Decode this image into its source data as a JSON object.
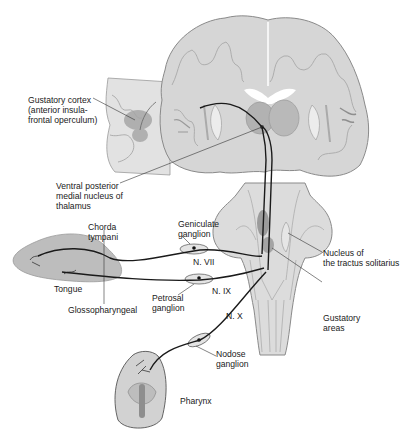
{
  "labels": {
    "gustatory_cortex": "Gustatory cortex\n(anterior insula-\nfrontal operculum)",
    "vpm_thalamus": "Ventral posterior\nmedial nucleus of\nthalamus",
    "chorda_tympani": "Chorda\ntympani",
    "geniculate_ganglion": "Geniculate\nganglion",
    "nerve_vii": "N. VII",
    "nerve_ix": "N. IX",
    "nerve_x": "N. X",
    "tongue": "Tongue",
    "glossopharyngeal": "Glossopharyngeal",
    "petrosal_ganglion": "Petrosal\nganglion",
    "nucleus_tractus_solitarius": "Nucleus of\nthe tractus solitarius",
    "gustatory_areas": "Gustatory\nareas",
    "nodose_ganglion": "Nodose\nganglion",
    "pharynx": "Pharynx"
  },
  "colors": {
    "tissue_fill": "#d6d6d6",
    "tissue_stroke": "#8a8a8a",
    "gray_matter": "#b8b8b8",
    "highlight": "#8f8f8f",
    "nerve": "#1a1a1a",
    "background": "#ffffff"
  }
}
